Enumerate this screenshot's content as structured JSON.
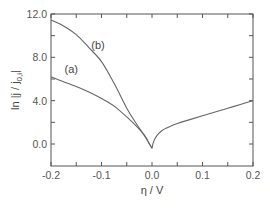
{
  "chart_data": {
    "type": "line",
    "title": "",
    "xlabel": "η / V",
    "ylabel_main": "ln |j / j",
    "ylabel_sub": "0,i",
    "ylabel_end": "|",
    "xlim": [
      -0.2,
      0.2
    ],
    "ylim": [
      -1.2,
      12.0
    ],
    "x_ticks": [
      -0.2,
      -0.1,
      0.0,
      0.1,
      0.2
    ],
    "x_tick_labels": [
      "-0.2",
      "-0.1",
      "0.0",
      "0.1",
      "0.2"
    ],
    "x_minor_ticks": [
      -0.15,
      -0.05,
      0.05,
      0.15
    ],
    "y_ticks": [
      0.0,
      4.0,
      8.0,
      12.0
    ],
    "y_tick_labels": [
      "0.0",
      "4.0",
      "8.0",
      "12.0"
    ],
    "y_minor_ticks": [
      2.0,
      6.0,
      10.0
    ],
    "grid": false,
    "series": [
      {
        "name": "(a)",
        "x": [
          -0.2,
          -0.175,
          -0.15,
          -0.125,
          -0.1,
          -0.075,
          -0.05,
          -0.03,
          -0.015,
          -0.005,
          0.0
        ],
        "y": [
          6.2,
          5.75,
          5.3,
          4.8,
          4.2,
          3.5,
          2.5,
          1.6,
          0.8,
          0.0,
          -0.4
        ]
      },
      {
        "name": "(b)",
        "x": [
          -0.2,
          -0.175,
          -0.15,
          -0.125,
          -0.1,
          -0.075,
          -0.05,
          -0.03,
          -0.015,
          -0.005,
          0.0
        ],
        "y": [
          11.45,
          10.9,
          10.1,
          8.9,
          7.6,
          5.6,
          3.3,
          1.8,
          0.8,
          0.0,
          -0.4
        ]
      },
      {
        "name": "anodic branch",
        "x": [
          0.0,
          0.003,
          0.01,
          0.02,
          0.03,
          0.05,
          0.075,
          0.1,
          0.125,
          0.15,
          0.175,
          0.2
        ],
        "y": [
          -0.4,
          0.2,
          0.8,
          1.25,
          1.5,
          1.9,
          2.25,
          2.6,
          2.95,
          3.3,
          3.65,
          4.0
        ]
      }
    ],
    "annotations": [
      {
        "text": "(a)",
        "x": -0.16,
        "y": 6.6
      },
      {
        "text": "(b)",
        "x": -0.107,
        "y": 8.8
      }
    ]
  }
}
